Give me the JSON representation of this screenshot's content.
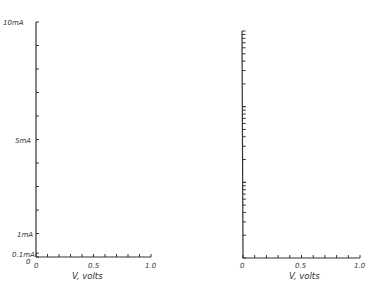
{
  "chart_data": [
    {
      "type": "line",
      "title": "",
      "xlabel": "V, volts",
      "ylabel": "",
      "yscale": "linear",
      "xlim": [
        0,
        1.0
      ],
      "ylim": [
        0,
        10
      ],
      "x_ticks": [
        0,
        0.1,
        0.2,
        0.3,
        0.4,
        0.5,
        0.6,
        0.7,
        0.8,
        0.9,
        1.0
      ],
      "x_tick_labels": [
        "0",
        "0.5",
        "1.0"
      ],
      "y_ticks_mA": [
        0,
        1,
        2,
        3,
        4,
        5,
        6,
        7,
        8,
        9,
        10
      ],
      "y_tick_labels": [
        "10mA",
        "5mA",
        "1mA",
        "0.1mA",
        "0"
      ],
      "series": [],
      "grid": false
    },
    {
      "type": "line",
      "title": "",
      "xlabel": "V, volts",
      "ylabel": "",
      "yscale": "log",
      "decades": 3,
      "xlim": [
        0,
        1.0
      ],
      "x_ticks": [
        0,
        0.1,
        0.2,
        0.3,
        0.4,
        0.5,
        0.6,
        0.7,
        0.8,
        0.9,
        1.0
      ],
      "x_tick_labels": [
        "0",
        "0.5",
        "1.0"
      ],
      "y_tick_labels": [],
      "series": [],
      "grid": false
    }
  ],
  "left": {
    "y_labels": {
      "top": "10mA",
      "mid": "5mA",
      "one": "1mA",
      "tenth": "0.1mA",
      "zero": "0"
    },
    "x_labels": {
      "zero": "0",
      "half": "0.5",
      "one": "1.0"
    },
    "xlabel": "V, volts"
  },
  "right": {
    "x_labels": {
      "zero": "0",
      "half": "0.5",
      "one": "1.0"
    },
    "xlabel": "V, volts"
  }
}
